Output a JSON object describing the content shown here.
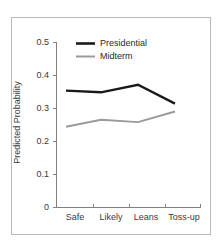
{
  "chart_data": {
    "type": "line",
    "title": "",
    "xlabel": "",
    "ylabel": "Predicted Probability",
    "categories": [
      "Safe",
      "Likely",
      "Leans",
      "Toss-up"
    ],
    "series": [
      {
        "name": "Presidential",
        "color": "#1a1a1a",
        "values": [
          0.353,
          0.348,
          0.371,
          0.314
        ]
      },
      {
        "name": "Midterm",
        "color": "#9a9a9a",
        "values": [
          0.244,
          0.265,
          0.258,
          0.29
        ]
      }
    ],
    "ylim": [
      0,
      0.5
    ],
    "yticks": [
      0,
      0.1,
      0.2,
      0.3,
      0.4,
      0.5
    ],
    "ytick_labels": [
      "0",
      "0.1",
      "0.2",
      "0.3",
      "0.4",
      "0.5"
    ],
    "xtick_labels": [
      "Safe",
      "Likely",
      "Leans",
      "Toss-up"
    ],
    "grid": false,
    "legend_position": "top-center",
    "axis_color": "#808080",
    "frame_color": "#b9b9b9",
    "background": "#ffffff"
  },
  "legend": {
    "entries": [
      {
        "label": "Presidential",
        "color": "#1a1a1a"
      },
      {
        "label": "Midterm",
        "color": "#9a9a9a"
      }
    ]
  },
  "axes": {
    "y_title": "Predicted Probability",
    "y_labels": [
      "0.5",
      "0.4",
      "0.3",
      "0.2",
      "0.1",
      "0"
    ],
    "x_labels": [
      "Safe",
      "Likely",
      "Leans",
      "Toss-up"
    ]
  }
}
